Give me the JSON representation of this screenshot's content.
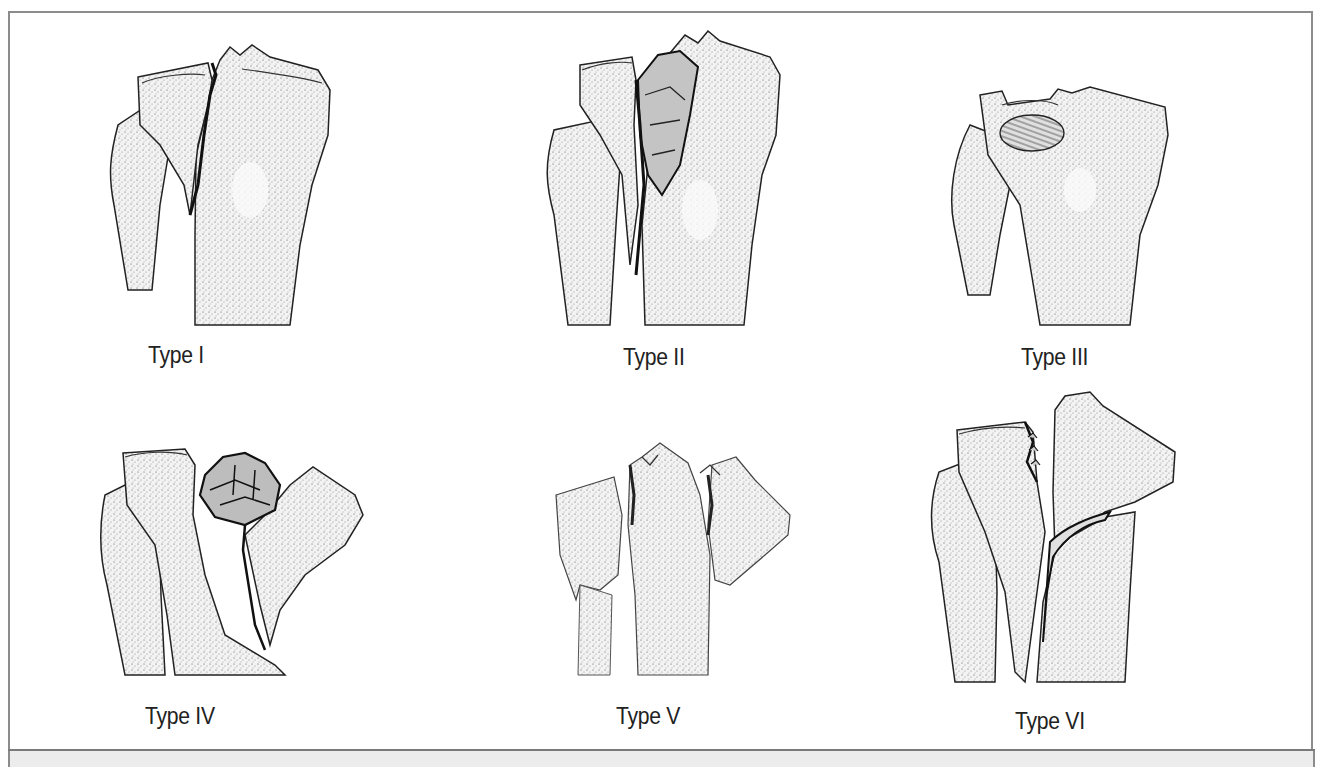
{
  "figure": {
    "panels": [
      {
        "id": "type-1",
        "label": "Type I"
      },
      {
        "id": "type-2",
        "label": "Type II"
      },
      {
        "id": "type-3",
        "label": "Type III"
      },
      {
        "id": "type-4",
        "label": "Type IV"
      },
      {
        "id": "type-5",
        "label": "Type V"
      },
      {
        "id": "type-6",
        "label": "Type VI"
      }
    ]
  },
  "colors": {
    "frame": "#8c8c8c",
    "ink": "#1e1e1e",
    "bone_fill": "#f4f4f4",
    "shade": "#c9c9c9",
    "fragment_fill": "#bdbdbd",
    "caption_strip": "#ececec"
  }
}
